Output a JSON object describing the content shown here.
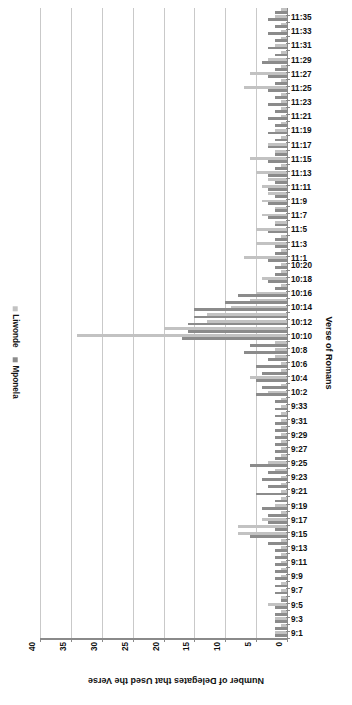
{
  "chart_data": {
    "type": "bar",
    "orientation": "horizontal",
    "title": "",
    "xlabel": "Number of Delegates that Used the Verse",
    "ylabel": "Verse of Romans",
    "xlim": [
      0,
      40
    ],
    "xticks": [
      40,
      35,
      30,
      25,
      20,
      15,
      10,
      5,
      0
    ],
    "grid": true,
    "legend_position": "left",
    "legend": [
      "Liwonde",
      "Mponela"
    ],
    "colors": {
      "Liwonde": "#c2c2c2",
      "Mponela": "#8b8b8b"
    },
    "categories": [
      "9:1",
      "9:2",
      "9:3",
      "9:4",
      "9:5",
      "9:6",
      "9:7",
      "9:8",
      "9:9",
      "9:10",
      "9:11",
      "9:12",
      "9:13",
      "9:14",
      "9:15",
      "9:16",
      "9:17",
      "9:18",
      "9:19",
      "9:20",
      "9:21",
      "9:22",
      "9:23",
      "9:24",
      "9:25",
      "9:26",
      "9:27",
      "9:28",
      "9:29",
      "9:30",
      "9:31",
      "9:32",
      "9:33",
      "10:1",
      "10:2",
      "10:3",
      "10:4",
      "10:5",
      "10:6",
      "10:7",
      "10:8",
      "10:9",
      "10:10",
      "10:11",
      "10:12",
      "10:13",
      "10:14",
      "10:15",
      "10:16",
      "10:17",
      "10:18",
      "10:19",
      "10:20",
      "11:1",
      "11:2",
      "11:3",
      "11:4",
      "11:5",
      "11:6",
      "11:7",
      "11:8",
      "11:9",
      "11:10",
      "11:11",
      "11:12",
      "11:13",
      "11:14",
      "11:15",
      "11:16",
      "11:17",
      "11:18",
      "11:19",
      "11:20",
      "11:21",
      "11:22",
      "11:23",
      "11:24",
      "11:25",
      "11:26",
      "11:27",
      "11:28",
      "11:29",
      "11:30",
      "11:31",
      "11:32",
      "11:33",
      "11:34",
      "11:35",
      "11:36"
    ],
    "tick_labels_shown": [
      "9:1",
      "9:3",
      "9:5",
      "9:7",
      "9:9",
      "9:11",
      "9:13",
      "9:15",
      "9:17",
      "9:19",
      "9:21",
      "9:23",
      "9:25",
      "9:27",
      "9:29",
      "9:31",
      "9:33",
      "10:2",
      "10:4",
      "10:6",
      "10:8",
      "10:10",
      "10:12",
      "10:14",
      "10:16",
      "10:18",
      "10:20",
      "11:1",
      "11:3",
      "11:5",
      "11:7",
      "11:9",
      "11:11",
      "11:13",
      "11:15",
      "11:17",
      "11:19",
      "11:21",
      "11:23",
      "11:25",
      "11:27",
      "11:29",
      "11:31",
      "11:33",
      "11:35"
    ],
    "series": [
      {
        "name": "Liwonde",
        "values": [
          2,
          1,
          2,
          1,
          3,
          1,
          1,
          1,
          1,
          1,
          1,
          1,
          1,
          1,
          8,
          8,
          4,
          1,
          2,
          1,
          1,
          1,
          1,
          2,
          3,
          1,
          1,
          1,
          1,
          1,
          1,
          1,
          1,
          1,
          3,
          1,
          6,
          1,
          1,
          2,
          2,
          2,
          34,
          20,
          13,
          13,
          9,
          6,
          5,
          1,
          4,
          1,
          1,
          7,
          1,
          5,
          1,
          5,
          2,
          4,
          2,
          4,
          3,
          4,
          3,
          5,
          1,
          6,
          2,
          3,
          1,
          2,
          1,
          1,
          1,
          1,
          1,
          7,
          1,
          6,
          1,
          3,
          1,
          2,
          1,
          1,
          1,
          2,
          1
        ]
      },
      {
        "name": "Mponela",
        "values": [
          2,
          2,
          2,
          2,
          2,
          1,
          2,
          2,
          2,
          2,
          2,
          2,
          2,
          3,
          6,
          2,
          3,
          3,
          4,
          2,
          5,
          3,
          4,
          3,
          6,
          2,
          2,
          2,
          2,
          2,
          2,
          2,
          2,
          2,
          5,
          4,
          5,
          4,
          5,
          3,
          7,
          6,
          17,
          16,
          16,
          15,
          15,
          10,
          8,
          2,
          3,
          2,
          2,
          3,
          2,
          2,
          2,
          3,
          2,
          3,
          2,
          3,
          2,
          3,
          2,
          3,
          2,
          3,
          2,
          3,
          2,
          3,
          2,
          3,
          2,
          3,
          2,
          3,
          2,
          3,
          2,
          4,
          2,
          3,
          2,
          3,
          2,
          3,
          2
        ]
      }
    ]
  }
}
